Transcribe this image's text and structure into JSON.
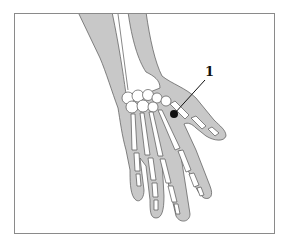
{
  "figure": {
    "background": "#ffffff",
    "frame_color": "#8a8a8a",
    "skin_color": "#c8c8c8",
    "bone_color": "#ffffff",
    "outline_color": "#555555",
    "marker_color": "#111111"
  },
  "labels": [
    {
      "id": "1",
      "text": "1",
      "x": 207,
      "y": 78
    }
  ],
  "marker": {
    "label_ref": "1",
    "x": 174,
    "y": 114
  }
}
